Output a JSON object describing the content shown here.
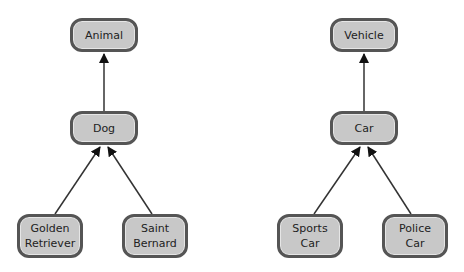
{
  "diagrams": [
    {
      "root": "Animal",
      "nodes": [
        {
          "id": "animal",
          "label": "Animal"
        },
        {
          "id": "dog",
          "label": "Dog"
        },
        {
          "id": "golden",
          "label": "Golden\nRetriever"
        },
        {
          "id": "saint",
          "label": "Saint\nBernard"
        }
      ],
      "edges": [
        {
          "from": "dog",
          "to": "animal"
        },
        {
          "from": "golden",
          "to": "dog"
        },
        {
          "from": "saint",
          "to": "dog"
        }
      ]
    },
    {
      "root": "Vehicle",
      "nodes": [
        {
          "id": "vehicle",
          "label": "Vehicle"
        },
        {
          "id": "car",
          "label": "Car"
        },
        {
          "id": "sports",
          "label": "Sports\nCar"
        },
        {
          "id": "police",
          "label": "Police\nCar"
        }
      ],
      "edges": [
        {
          "from": "car",
          "to": "vehicle"
        },
        {
          "from": "sports",
          "to": "car"
        },
        {
          "from": "police",
          "to": "car"
        }
      ]
    }
  ],
  "colors": {
    "node_fill": "#c8c8c8",
    "node_border": "#555555",
    "edge": "#222222"
  }
}
